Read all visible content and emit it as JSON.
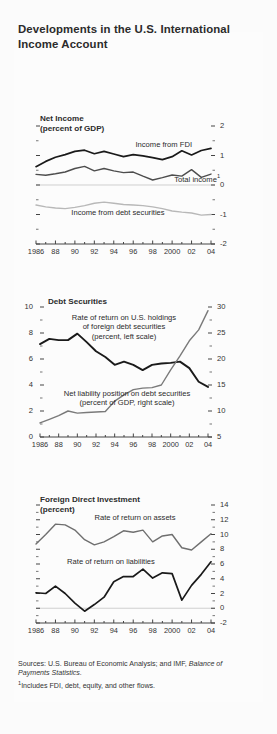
{
  "figure": {
    "title": "Developments in the U.S. International Income Account",
    "sources_label": "Sources:",
    "sources_text": "U.S. Bureau of Economic Analysis; and IMF,",
    "sources_italic": "Balance of Payments Statistics.",
    "footnote_marker": "1",
    "footnote_text": "Includes FDI, debt, equity, and other flows."
  },
  "chart_data": [
    {
      "type": "line",
      "id": "net-income",
      "title": "Net Income",
      "subtitle": "(percent of GDP)",
      "xlabel": "",
      "ylabel": "",
      "ylim": [
        -2,
        2
      ],
      "yticks": [
        -2,
        -1,
        0,
        1,
        2
      ],
      "ytick_labels": [
        "-2",
        "-1",
        "0",
        "1",
        "2"
      ],
      "y_axis_side": "right",
      "minor_ticks": true,
      "grid": false,
      "zero_line": true,
      "x": [
        1986,
        1987,
        1988,
        1989,
        1990,
        1991,
        1992,
        1993,
        1994,
        1995,
        1996,
        1997,
        1998,
        1999,
        2000,
        2001,
        2002,
        2003,
        2004
      ],
      "xticks": [
        1986,
        1988,
        1990,
        1992,
        1994,
        1996,
        1998,
        2000,
        2002,
        2004
      ],
      "xtick_labels": [
        "1986",
        "88",
        "90",
        "92",
        "94",
        "96",
        "98",
        "2000",
        "02",
        "04"
      ],
      "series": [
        {
          "name": "Income from FDI",
          "color": "#1a1a1a",
          "width": 1.7,
          "values": [
            0.62,
            0.8,
            0.94,
            1.03,
            1.14,
            1.18,
            1.06,
            1.14,
            1.05,
            0.96,
            1.03,
            0.99,
            0.93,
            0.86,
            0.96,
            1.16,
            1.02,
            1.17,
            1.24
          ]
        },
        {
          "name": "Total income",
          "color": "#4d4d4d",
          "width": 1.4,
          "footnote": "1",
          "values": [
            0.36,
            0.33,
            0.38,
            0.44,
            0.56,
            0.63,
            0.48,
            0.56,
            0.48,
            0.42,
            0.44,
            0.3,
            0.17,
            0.25,
            0.34,
            0.3,
            0.52,
            0.26,
            0.37
          ]
        },
        {
          "name": "Income from debt securities",
          "color": "#b8b8b8",
          "width": 1.4,
          "values": [
            -0.68,
            -0.74,
            -0.78,
            -0.8,
            -0.76,
            -0.7,
            -0.62,
            -0.58,
            -0.62,
            -0.66,
            -0.68,
            -0.7,
            -0.74,
            -0.8,
            -0.88,
            -0.92,
            -0.95,
            -1.02,
            -1.0
          ]
        }
      ]
    },
    {
      "type": "line",
      "id": "debt-securities",
      "title": "Debt Securities",
      "subtitle": "",
      "ylim": [
        0,
        10
      ],
      "yticks": [
        0,
        2,
        4,
        6,
        8,
        10
      ],
      "ytick_labels": [
        "0",
        "2",
        "4",
        "6",
        "8",
        "10"
      ],
      "y2lim": [
        5,
        30
      ],
      "y2ticks": [
        5,
        10,
        15,
        20,
        25,
        30
      ],
      "y2tick_labels": [
        "5",
        "10",
        "15",
        "20",
        "25",
        "30"
      ],
      "minor_ticks": true,
      "grid": false,
      "x": [
        1986,
        1987,
        1988,
        1989,
        1990,
        1991,
        1992,
        1993,
        1994,
        1995,
        1996,
        1997,
        1998,
        1999,
        2000,
        2001,
        2002,
        2003,
        2004
      ],
      "xticks": [
        1986,
        1988,
        1990,
        1992,
        1994,
        1996,
        1998,
        2000,
        2002,
        2004
      ],
      "xtick_labels": [
        "1986",
        "88",
        "90",
        "92",
        "94",
        "96",
        "98",
        "2000",
        "02",
        "04"
      ],
      "series": [
        {
          "name": "Rate of return on U.S. holdings of foreign debt securities",
          "axis_note": "(percent, left scale)",
          "axis": "left",
          "color": "#1a1a1a",
          "width": 1.9,
          "values": [
            7.15,
            7.55,
            7.45,
            7.45,
            7.95,
            7.3,
            6.6,
            6.15,
            5.55,
            5.8,
            5.55,
            5.15,
            5.55,
            5.65,
            5.7,
            5.8,
            5.3,
            4.25,
            3.85
          ]
        },
        {
          "name": "Net liability position on debt securities",
          "axis_note": "(percent of GDP, right scale)",
          "axis": "right",
          "color": "#7a7a7a",
          "width": 1.4,
          "values": [
            7.7,
            8.4,
            9.1,
            10.0,
            9.6,
            9.7,
            9.8,
            9.9,
            11.9,
            13.1,
            14.1,
            14.4,
            14.5,
            15.0,
            17.9,
            20.6,
            23.5,
            25.6,
            29.3
          ]
        }
      ]
    },
    {
      "type": "line",
      "id": "foreign-direct-investment",
      "title": "Foreign Direct Investment",
      "subtitle": "(percent)",
      "ylim": [
        -2,
        14
      ],
      "yticks": [
        -2,
        0,
        2,
        4,
        6,
        8,
        10,
        12,
        14
      ],
      "ytick_labels": [
        "-2",
        "0",
        "2",
        "4",
        "6",
        "8",
        "10",
        "12",
        "14"
      ],
      "y_axis_side": "right",
      "minor_ticks": true,
      "grid": false,
      "zero_line": true,
      "x": [
        1986,
        1987,
        1988,
        1989,
        1990,
        1991,
        1992,
        1993,
        1994,
        1995,
        1996,
        1997,
        1998,
        1999,
        2000,
        2001,
        2002,
        2003,
        2004
      ],
      "xticks": [
        1986,
        1988,
        1990,
        1992,
        1994,
        1996,
        1998,
        2000,
        2002,
        2004
      ],
      "xtick_labels": [
        "1986",
        "88",
        "90",
        "92",
        "94",
        "96",
        "98",
        "2000",
        "02",
        "04"
      ],
      "series": [
        {
          "name": "Rate of return on assets",
          "color": "#6f6f6f",
          "width": 1.4,
          "values": [
            8.7,
            10.0,
            11.4,
            11.3,
            10.6,
            9.3,
            8.6,
            9.0,
            9.7,
            10.5,
            10.3,
            10.6,
            9.0,
            9.8,
            10.0,
            8.2,
            7.9,
            9.0,
            10.1
          ]
        },
        {
          "name": "Rate of return on liabilities",
          "color": "#1a1a1a",
          "width": 1.7,
          "values": [
            2.1,
            2.0,
            3.0,
            2.0,
            0.7,
            -0.4,
            0.5,
            1.5,
            3.6,
            4.3,
            4.3,
            5.3,
            4.1,
            4.8,
            4.7,
            1.1,
            3.1,
            4.6,
            6.3
          ]
        }
      ]
    }
  ]
}
